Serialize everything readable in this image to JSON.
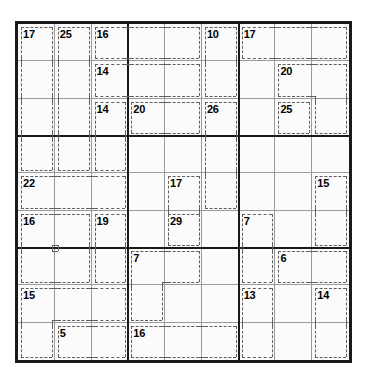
{
  "puzzle": {
    "type": "killer-sudoku",
    "grid_size": 9,
    "box_size": 3,
    "given_values": [],
    "colors": {
      "page_background": "#ffffff",
      "grid_background": "#fbfbfb",
      "outer_border": "#1a1a1a",
      "box_line": "#1a1a1a",
      "cell_line": "#9a9a9a",
      "cage_line": "#606060",
      "sum_text": "#000000"
    },
    "geometry": {
      "grid_left": 15,
      "grid_top": 21,
      "grid_width": 337,
      "grid_height": 342,
      "cell_width": 36.78,
      "cell_height": 37.33
    },
    "cages": [
      {
        "sum": "17",
        "anchor": {
          "row": 1,
          "col": 1
        },
        "cells": [
          [
            1,
            1
          ],
          [
            2,
            1
          ],
          [
            3,
            1
          ],
          [
            4,
            1
          ]
        ]
      },
      {
        "sum": "25",
        "anchor": {
          "row": 1,
          "col": 2
        },
        "cells": [
          [
            1,
            2
          ],
          [
            2,
            2
          ],
          [
            3,
            2
          ],
          [
            4,
            2
          ]
        ]
      },
      {
        "sum": "16",
        "anchor": {
          "row": 1,
          "col": 3
        },
        "cells": [
          [
            1,
            3
          ],
          [
            1,
            4
          ],
          [
            1,
            5
          ]
        ]
      },
      {
        "sum": "10",
        "anchor": {
          "row": 1,
          "col": 6
        },
        "cells": [
          [
            1,
            6
          ],
          [
            2,
            6
          ]
        ]
      },
      {
        "sum": "17",
        "anchor": {
          "row": 1,
          "col": 7
        },
        "cells": [
          [
            1,
            7
          ],
          [
            1,
            8
          ],
          [
            1,
            9
          ]
        ]
      },
      {
        "sum": "14",
        "anchor": {
          "row": 2,
          "col": 3
        },
        "cells": [
          [
            2,
            3
          ],
          [
            2,
            4
          ],
          [
            2,
            5
          ]
        ]
      },
      {
        "sum": "20",
        "anchor": {
          "row": 2,
          "col": 8
        },
        "cells": [
          [
            2,
            8
          ],
          [
            2,
            9
          ],
          [
            3,
            9
          ]
        ]
      },
      {
        "sum": "14",
        "anchor": {
          "row": 3,
          "col": 3
        },
        "cells": [
          [
            3,
            3
          ],
          [
            4,
            3
          ]
        ]
      },
      {
        "sum": "20",
        "anchor": {
          "row": 3,
          "col": 4
        },
        "cells": [
          [
            3,
            4
          ],
          [
            3,
            5
          ]
        ]
      },
      {
        "sum": "26",
        "anchor": {
          "row": 3,
          "col": 6
        },
        "cells": [
          [
            3,
            6
          ],
          [
            4,
            6
          ],
          [
            5,
            6
          ]
        ]
      },
      {
        "sum": "25",
        "anchor": {
          "row": 3,
          "col": 8
        },
        "cells": [
          [
            3,
            8
          ]
        ]
      },
      {
        "sum": "22",
        "anchor": {
          "row": 5,
          "col": 1
        },
        "cells": [
          [
            5,
            1
          ],
          [
            5,
            2
          ],
          [
            5,
            3
          ]
        ]
      },
      {
        "sum": "17",
        "anchor": {
          "row": 5,
          "col": 5
        },
        "cells": [
          [
            5,
            5
          ],
          [
            6,
            5
          ]
        ]
      },
      {
        "sum": "15",
        "anchor": {
          "row": 5,
          "col": 9
        },
        "cells": [
          [
            5,
            9
          ],
          [
            6,
            9
          ]
        ]
      },
      {
        "sum": "16",
        "anchor": {
          "row": 6,
          "col": 1
        },
        "cells": [
          [
            6,
            1
          ],
          [
            6,
            2
          ],
          [
            7,
            1
          ],
          [
            7,
            2
          ]
        ]
      },
      {
        "sum": "19",
        "anchor": {
          "row": 6,
          "col": 3
        },
        "cells": [
          [
            6,
            3
          ],
          [
            7,
            3
          ]
        ]
      },
      {
        "sum": "29",
        "anchor": {
          "row": 6,
          "col": 5
        },
        "cells": [
          [
            6,
            5
          ]
        ]
      },
      {
        "sum": "7",
        "anchor": {
          "row": 6,
          "col": 7
        },
        "cells": [
          [
            6,
            7
          ],
          [
            7,
            7
          ]
        ]
      },
      {
        "sum": "7",
        "anchor": {
          "row": 7,
          "col": 4
        },
        "cells": [
          [
            7,
            4
          ],
          [
            7,
            5
          ],
          [
            8,
            4
          ]
        ]
      },
      {
        "sum": "6",
        "anchor": {
          "row": 7,
          "col": 8
        },
        "cells": [
          [
            7,
            8
          ],
          [
            7,
            9
          ]
        ]
      },
      {
        "sum": "15",
        "anchor": {
          "row": 8,
          "col": 1
        },
        "cells": [
          [
            8,
            1
          ],
          [
            8,
            2
          ],
          [
            8,
            3
          ],
          [
            9,
            1
          ]
        ]
      },
      {
        "sum": "13",
        "anchor": {
          "row": 8,
          "col": 7
        },
        "cells": [
          [
            8,
            7
          ],
          [
            9,
            7
          ]
        ]
      },
      {
        "sum": "14",
        "anchor": {
          "row": 8,
          "col": 9
        },
        "cells": [
          [
            8,
            9
          ],
          [
            9,
            9
          ]
        ]
      },
      {
        "sum": "5",
        "anchor": {
          "row": 9,
          "col": 2
        },
        "cells": [
          [
            9,
            2
          ],
          [
            9,
            3
          ]
        ]
      },
      {
        "sum": "16",
        "anchor": {
          "row": 9,
          "col": 4
        },
        "cells": [
          [
            9,
            4
          ],
          [
            9,
            5
          ],
          [
            9,
            6
          ]
        ]
      }
    ]
  }
}
